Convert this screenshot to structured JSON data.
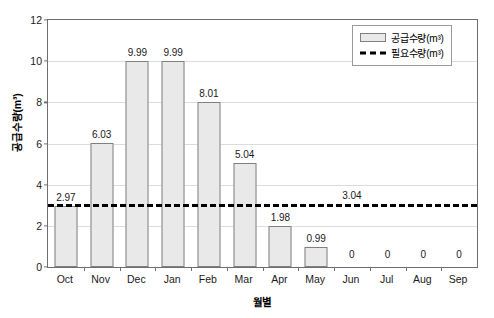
{
  "chart_data": {
    "type": "bar",
    "title": "",
    "subtitle": "",
    "xlabel": "월별",
    "ylabel": "공급수량(m³)",
    "categories": [
      "Oct",
      "Nov",
      "Dec",
      "Jan",
      "Feb",
      "Mar",
      "Apr",
      "May",
      "Jun",
      "Jul",
      "Aug",
      "Sep"
    ],
    "series": [
      {
        "name": "공급수량(m³)",
        "type": "bar",
        "values": [
          2.97,
          6.03,
          9.99,
          9.99,
          8.01,
          5.04,
          1.98,
          0.99,
          0,
          0,
          0,
          0
        ],
        "data_labels": [
          "2.97",
          "6.03",
          "9.99",
          "9.99",
          "8.01",
          "5.04",
          "1.98",
          "0.99",
          "0",
          "0",
          "0",
          "0"
        ],
        "fill_color": "#e9e9e9",
        "border_color": "#808080"
      },
      {
        "name": "필요수량(m³)",
        "type": "line",
        "style": "dash-dot",
        "constant_value": 3.04,
        "data_label": "3.04",
        "color": "#000000"
      }
    ],
    "ylim": [
      0,
      12
    ],
    "yticks": [
      0,
      2,
      4,
      6,
      8,
      10,
      12
    ],
    "ytick_labels": [
      "0",
      "2",
      "4",
      "6",
      "8",
      "10",
      "12"
    ],
    "grid": true,
    "grid_axis": "y",
    "legend_position": "top-right",
    "legend_entries": [
      "공급수량(m³)",
      "필요수량(m³)"
    ]
  },
  "axes": {
    "y_title": "공급수량(m³)",
    "x_title": "월별"
  },
  "legend": {
    "supply_label": "공급수량(m³)",
    "required_label": "필요수량(m³)"
  },
  "colors": {
    "bar_fill": "#e9e9e9",
    "bar_border": "#808080",
    "line": "#000000",
    "grid": "#dcdcdc",
    "axis": "#6e6e6e",
    "text": "#1a1a1a",
    "background": "#ffffff"
  }
}
